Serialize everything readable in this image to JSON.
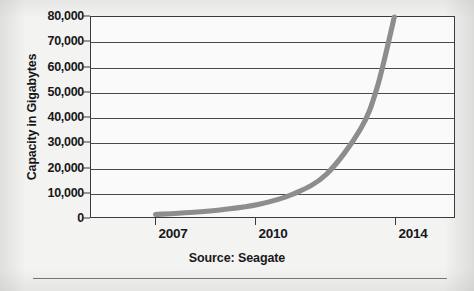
{
  "chart_data": {
    "type": "line",
    "title": "",
    "subtitle": "",
    "xlabel": "",
    "ylabel": "Capacity in Gigabytes",
    "source_note": "Source: Seagate",
    "grid": true,
    "legend": "none",
    "xlim": [
      2006.3,
      2015.3
    ],
    "ylim": [
      0,
      80000
    ],
    "x_tick_labels": [
      "2007",
      "2010",
      "2014"
    ],
    "x_tick_values": [
      2007,
      2010,
      2014
    ],
    "y_tick_labels": [
      "0",
      "10,000",
      "20,000",
      "30,000",
      "40,000",
      "50,000",
      "60,000",
      "70,000",
      "80,000"
    ],
    "y_tick_values": [
      0,
      10000,
      20000,
      30000,
      40000,
      50000,
      60000,
      70000,
      80000
    ],
    "series": [
      {
        "name": "Hard drive capacity",
        "color": "#8d8d8d",
        "x": [
          2007,
          2008,
          2009,
          2010,
          2011,
          2012,
          2013,
          2013.5,
          2014
        ],
        "y": [
          1000,
          1800,
          3000,
          5000,
          9000,
          17000,
          35000,
          52000,
          80000
        ]
      }
    ]
  },
  "axes": {
    "y_title": "Capacity in Gigabytes",
    "y_ticks": [
      {
        "label": "80,000",
        "value": 80000
      },
      {
        "label": "70,000",
        "value": 70000
      },
      {
        "label": "60,000",
        "value": 60000
      },
      {
        "label": "50,000",
        "value": 50000
      },
      {
        "label": "40,000",
        "value": 40000
      },
      {
        "label": "30,000",
        "value": 30000
      },
      {
        "label": "20,000",
        "value": 20000
      },
      {
        "label": "10,000",
        "value": 10000
      },
      {
        "label": "0",
        "value": 0
      }
    ],
    "x_ticks": [
      {
        "label": "2007",
        "value": 2007
      },
      {
        "label": "2010",
        "value": 2010
      },
      {
        "label": "2014",
        "value": 2014
      }
    ]
  },
  "caption": {
    "source": "Source: Seagate"
  },
  "colors": {
    "curve": "#8d8d8d",
    "gridline": "#4a4a4c",
    "frame": "#3b3b3d",
    "text": "#17171a",
    "plot_background": "#fafafa",
    "page_background": "#f3f3f1"
  }
}
